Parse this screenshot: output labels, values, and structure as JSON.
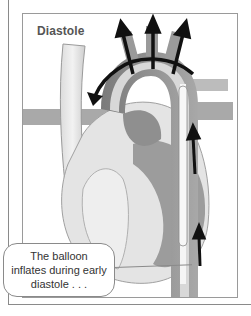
{
  "figure": {
    "phase_label": "Diastole",
    "callout_text": "The balloon inflates during early diastole . . .",
    "callout_lines": [
      "The balloon",
      "inflates during early",
      "diastole . . ."
    ]
  },
  "colors": {
    "frame": "#8a8a8a",
    "arrow": "#111111",
    "vessel_dark": "#8c8c8c",
    "vessel_mid": "#bdbdbd",
    "tissue_light": "#e6e6e6",
    "chamber_dark": "#9a9a9a"
  },
  "arrows": {
    "upward_outflow_count": 3,
    "aortic_arch_arrow": "counter-clockwise",
    "catheter_arrows_count": 2
  }
}
